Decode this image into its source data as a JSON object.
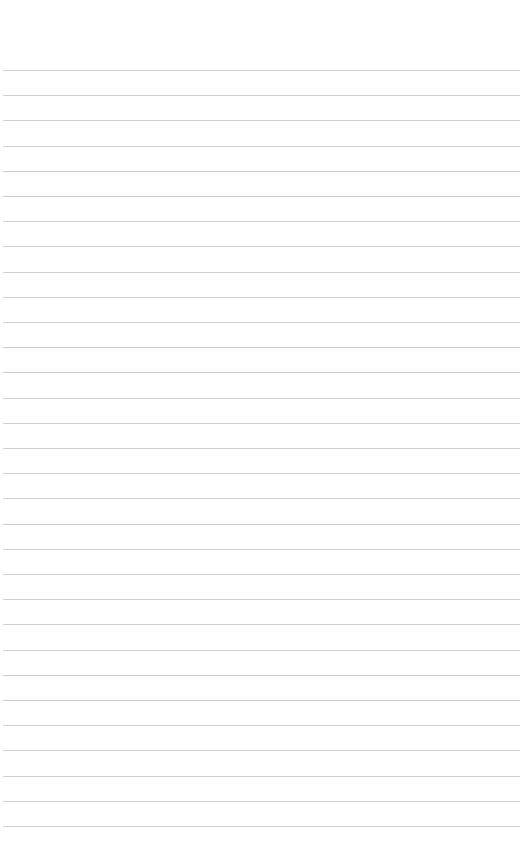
{
  "page": {
    "type": "lined-paper",
    "background_color": "#ffffff",
    "line_color": "#cfcfcf",
    "first_line_y": 70,
    "line_spacing": 25.2,
    "line_count": 31,
    "line_left": 3,
    "line_width": 517,
    "text": ""
  }
}
